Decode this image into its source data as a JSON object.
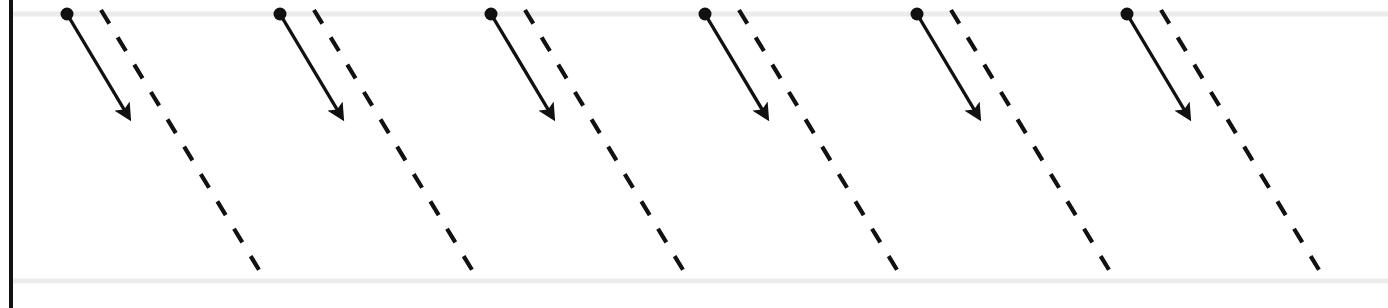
{
  "figure": {
    "type": "diagram",
    "width": 1388,
    "height": 308,
    "background_color": "#ffffff",
    "axis": {
      "vertical_axis": {
        "name": "vertical-axis",
        "x": 11,
        "y_top": 0,
        "y_bottom": 308,
        "color": "#111111",
        "stroke_width": 4
      },
      "upper_baseline": {
        "name": "upper-baseline",
        "y": 14,
        "x_start": 11,
        "x_end": 1388,
        "color": "#ececec",
        "stroke_width": 5
      },
      "lower_baseline": {
        "name": "lower-baseline",
        "y": 281,
        "x_start": 11,
        "x_end": 1388,
        "color": "#ececec",
        "stroke_width": 5
      }
    },
    "series": {
      "solid_arrow": {
        "name": "solid-arrow-series",
        "color": "#111111",
        "stroke_width": 3.4,
        "dot_radius": 6.5,
        "dx": 61,
        "dy": 102,
        "marker": "arrowhead"
      },
      "dashed_line": {
        "name": "dashed-line-series",
        "color": "#111111",
        "stroke_width": 4.2,
        "dash_pattern": "16 16",
        "dx": 166,
        "dy": 273
      }
    },
    "items": [
      {
        "index": 1,
        "label": "group-1",
        "dot": {
          "x": 67,
          "y": 14
        },
        "arrow_tip": {
          "x": 128,
          "y": 116
        },
        "dash_start": {
          "x": 101,
          "y": 10
        },
        "dash_end": {
          "x": 267,
          "y": 283
        }
      },
      {
        "index": 2,
        "label": "group-2",
        "dot": {
          "x": 280,
          "y": 14
        },
        "arrow_tip": {
          "x": 341,
          "y": 116
        },
        "dash_start": {
          "x": 314,
          "y": 10
        },
        "dash_end": {
          "x": 480,
          "y": 283
        }
      },
      {
        "index": 3,
        "label": "group-3",
        "dot": {
          "x": 491,
          "y": 14
        },
        "arrow_tip": {
          "x": 552,
          "y": 116
        },
        "dash_start": {
          "x": 525,
          "y": 10
        },
        "dash_end": {
          "x": 691,
          "y": 283
        }
      },
      {
        "index": 4,
        "label": "group-4",
        "dot": {
          "x": 705,
          "y": 14
        },
        "arrow_tip": {
          "x": 766,
          "y": 116
        },
        "dash_start": {
          "x": 739,
          "y": 10
        },
        "dash_end": {
          "x": 905,
          "y": 283
        }
      },
      {
        "index": 5,
        "label": "group-5",
        "dot": {
          "x": 917,
          "y": 14
        },
        "arrow_tip": {
          "x": 978,
          "y": 116
        },
        "dash_start": {
          "x": 951,
          "y": 10
        },
        "dash_end": {
          "x": 1117,
          "y": 283
        }
      },
      {
        "index": 6,
        "label": "group-6",
        "dot": {
          "x": 1127,
          "y": 14
        },
        "arrow_tip": {
          "x": 1188,
          "y": 116
        },
        "dash_start": {
          "x": 1161,
          "y": 10
        },
        "dash_end": {
          "x": 1327,
          "y": 283
        }
      }
    ]
  }
}
